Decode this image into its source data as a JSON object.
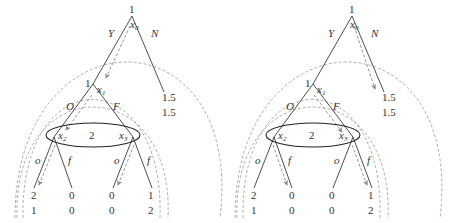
{
  "trees": [
    {
      "id": "left",
      "root": {
        "player": "1",
        "node": "x",
        "sub": "0"
      },
      "actions_root": {
        "left": "Y",
        "right": "N"
      },
      "n_payoff": {
        "p1": "1.5",
        "p2": "1.5"
      },
      "x1": {
        "player": "1",
        "node": "x",
        "sub": "1"
      },
      "actions_x1": {
        "left": "O",
        "right": "F"
      },
      "infoset": {
        "player": "2",
        "left_node": "x",
        "left_sub": "2",
        "right_node": "x",
        "right_sub": "3"
      },
      "actions_x2": {
        "left": "o",
        "right": "f"
      },
      "actions_x3": {
        "left": "o",
        "right": "f"
      },
      "leaves": [
        {
          "p1": "2",
          "p2": "1"
        },
        {
          "p1": "0",
          "p2": "0"
        },
        {
          "p1": "0",
          "p2": "0"
        },
        {
          "p1": "1",
          "p2": "2"
        }
      ],
      "highlighted_path": "Y → O → o (x2), o (x3)"
    },
    {
      "id": "right",
      "root": {
        "player": "1",
        "node": "x",
        "sub": "0"
      },
      "actions_root": {
        "left": "Y",
        "right": "N"
      },
      "n_payoff": {
        "p1": "1.5",
        "p2": "1.5"
      },
      "x1": {
        "player": "1",
        "node": "x",
        "sub": "1"
      },
      "actions_x1": {
        "left": "O",
        "right": "F"
      },
      "infoset": {
        "player": "2",
        "left_node": "x",
        "left_sub": "2",
        "right_node": "x",
        "right_sub": "3"
      },
      "actions_x2": {
        "left": "o",
        "right": "f"
      },
      "actions_x3": {
        "left": "o",
        "right": "f"
      },
      "leaves": [
        {
          "p1": "2",
          "p2": "1"
        },
        {
          "p1": "0",
          "p2": "0"
        },
        {
          "p1": "0",
          "p2": "0"
        },
        {
          "p1": "1",
          "p2": "2"
        }
      ],
      "highlighted_path": "N; F → f (x2), f (x3)"
    }
  ],
  "colors": {
    "edge": "#3a3a3a",
    "subgame_arc": "#a8a8a8",
    "strategy_arrow": "#8a8a8a",
    "infoset": "#222222"
  }
}
